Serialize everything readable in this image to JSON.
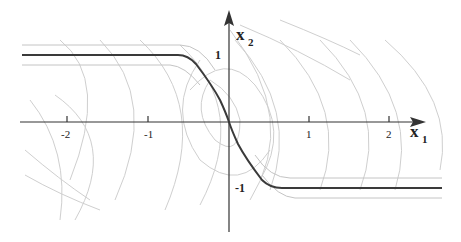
{
  "diagram": {
    "type": "phase-portrait",
    "axes": {
      "x": {
        "label": "x",
        "subscript": "1",
        "ticks": [
          "-2",
          "-1",
          "1",
          "2"
        ]
      },
      "y": {
        "label": "x",
        "subscript": "2",
        "ticks": [
          "1",
          "-1"
        ]
      }
    },
    "curves": {
      "switching_curve": "thick dark curve: saturated at x2=1 for x1<-0.6, passes through origin, saturated at x2=-1 for x1>0.6",
      "boundary_lines": "light parallel lines at x2≈±1.15 and ±0.85",
      "trajectories": "family of light parabolic arcs (level curves) opening to the right"
    },
    "colors": {
      "axis": "#333333",
      "main_curve": "#3a3a3a",
      "light_curves": "#c8c8c8"
    }
  }
}
